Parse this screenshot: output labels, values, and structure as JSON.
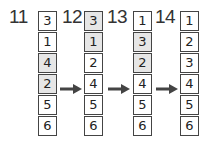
{
  "diagram": {
    "colors": {
      "shaded": "#e6e6e6",
      "border": "#444444",
      "arrow": "#444444"
    },
    "steps": [
      {
        "label": "11",
        "cells": [
          {
            "value": "3",
            "shaded": false
          },
          {
            "value": "1",
            "shaded": false
          },
          {
            "value": "4",
            "shaded": true
          },
          {
            "value": "2",
            "shaded": true
          },
          {
            "value": "5",
            "shaded": false
          },
          {
            "value": "6",
            "shaded": false
          }
        ]
      },
      {
        "label": "12",
        "cells": [
          {
            "value": "3",
            "shaded": true
          },
          {
            "value": "1",
            "shaded": true
          },
          {
            "value": "2",
            "shaded": false
          },
          {
            "value": "4",
            "shaded": false
          },
          {
            "value": "5",
            "shaded": false
          },
          {
            "value": "6",
            "shaded": false
          }
        ]
      },
      {
        "label": "13",
        "cells": [
          {
            "value": "1",
            "shaded": false
          },
          {
            "value": "3",
            "shaded": true
          },
          {
            "value": "2",
            "shaded": true
          },
          {
            "value": "4",
            "shaded": false
          },
          {
            "value": "5",
            "shaded": false
          },
          {
            "value": "6",
            "shaded": false
          }
        ]
      },
      {
        "label": "14",
        "cells": [
          {
            "value": "1",
            "shaded": false
          },
          {
            "value": "2",
            "shaded": false
          },
          {
            "value": "3",
            "shaded": false
          },
          {
            "value": "4",
            "shaded": false
          },
          {
            "value": "5",
            "shaded": false
          },
          {
            "value": "6",
            "shaded": false
          }
        ]
      }
    ],
    "arrows": [
      {
        "from": "11",
        "to": "12",
        "row": 4
      },
      {
        "from": "12",
        "to": "13",
        "row": 4
      },
      {
        "from": "13",
        "to": "14",
        "row": 4
      }
    ]
  }
}
